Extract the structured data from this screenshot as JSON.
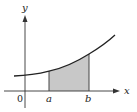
{
  "diagram": {
    "type": "area-under-curve",
    "labels": {
      "y_axis": "y",
      "x_axis": "x",
      "origin": "0",
      "lower_bound": "a",
      "upper_bound": "b"
    },
    "colors": {
      "axis": "#333333",
      "curve": "#222222",
      "shaded_region": "#c8c8c8",
      "bound_lines": "#444444"
    },
    "geometry": {
      "origin_px": [
        25,
        91
      ],
      "x_axis_end_px": 119,
      "y_axis_top_px": 14,
      "a_px": 49,
      "b_px": 89,
      "curve_start_px": [
        14,
        76
      ],
      "curve_end_px": [
        115,
        35
      ]
    }
  }
}
